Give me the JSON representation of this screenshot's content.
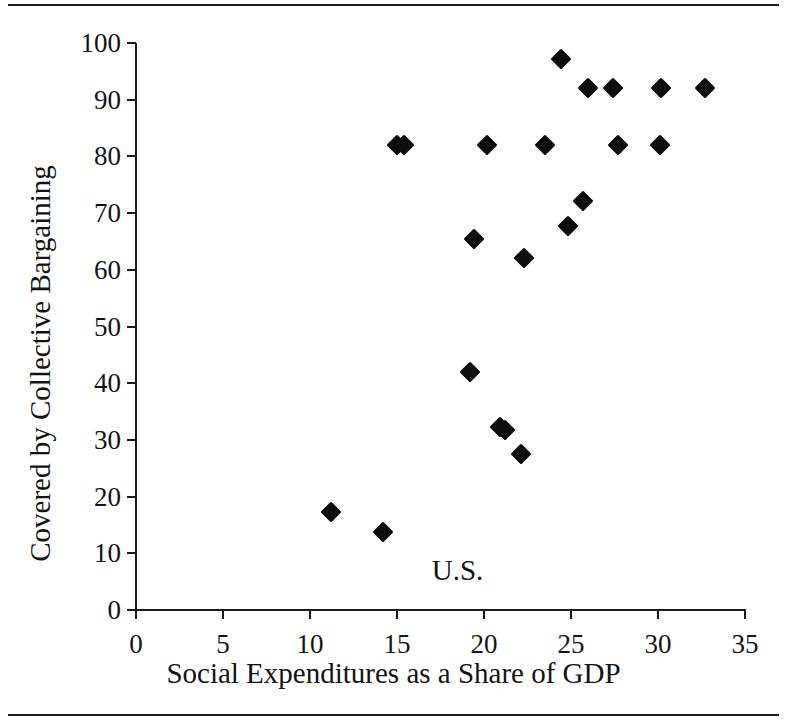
{
  "figure": {
    "has_top_rule": true,
    "has_bottom_rule": true,
    "background_color": "#ffffff",
    "ink_color": "#111111"
  },
  "annotations": [
    {
      "name": "us-label",
      "text": "U.S.",
      "x": 17.0,
      "y": 9.5
    }
  ],
  "chart_data": {
    "type": "scatter",
    "title": "",
    "subtitle": "",
    "xlabel": "Social Expenditures as a Share of GDP",
    "ylabel": "Covered by Collective Bargaining",
    "xlim": [
      0,
      35
    ],
    "ylim": [
      0,
      100
    ],
    "xticks": [
      0,
      5,
      10,
      15,
      20,
      25,
      30,
      35
    ],
    "yticks": [
      0,
      10,
      20,
      30,
      40,
      50,
      60,
      70,
      80,
      90,
      100
    ],
    "xtick_labels": [
      "0",
      "5",
      "10",
      "15",
      "20",
      "25",
      "30",
      "35"
    ],
    "ytick_labels": [
      "0",
      "10",
      "20",
      "30",
      "40",
      "50",
      "60",
      "70",
      "80",
      "90",
      "100"
    ],
    "grid": false,
    "legend": null,
    "marker": "diamond",
    "marker_color": "#0d0d0d",
    "series": [
      {
        "name": "Countries",
        "points": [
          {
            "x": 11.2,
            "y": 17.3
          },
          {
            "x": 14.2,
            "y": 13.8
          },
          {
            "x": 15.0,
            "y": 82.0
          },
          {
            "x": 15.4,
            "y": 82.0
          },
          {
            "x": 19.2,
            "y": 42.0
          },
          {
            "x": 19.4,
            "y": 65.5
          },
          {
            "x": 20.2,
            "y": 82.0
          },
          {
            "x": 20.9,
            "y": 32.2
          },
          {
            "x": 21.2,
            "y": 31.8
          },
          {
            "x": 22.1,
            "y": 27.5
          },
          {
            "x": 22.3,
            "y": 62.0
          },
          {
            "x": 23.5,
            "y": 82.0
          },
          {
            "x": 24.4,
            "y": 97.2
          },
          {
            "x": 24.8,
            "y": 67.7
          },
          {
            "x": 25.7,
            "y": 72.2
          },
          {
            "x": 26.0,
            "y": 92.0
          },
          {
            "x": 27.4,
            "y": 92.0
          },
          {
            "x": 27.7,
            "y": 82.0
          },
          {
            "x": 30.1,
            "y": 82.0
          },
          {
            "x": 30.2,
            "y": 92.0
          },
          {
            "x": 32.7,
            "y": 92.0
          }
        ]
      }
    ]
  }
}
